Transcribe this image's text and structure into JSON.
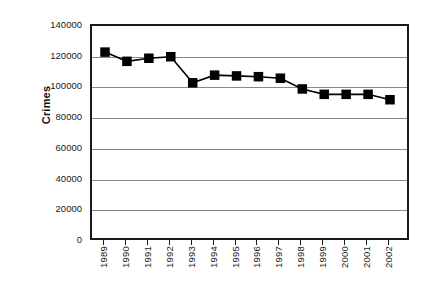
{
  "chart_data": {
    "type": "line",
    "title": "",
    "xlabel": "",
    "ylabel": "Crimes",
    "categories": [
      "1989",
      "1990",
      "1991",
      "1992",
      "1993",
      "1994",
      "1995",
      "1996",
      "1997",
      "1998",
      "1999",
      "2000",
      "2001",
      "2002"
    ],
    "values": [
      123000,
      117000,
      119000,
      120000,
      103000,
      108000,
      107500,
      107000,
      106000,
      99000,
      95500,
      95500,
      95500,
      92000
    ],
    "series": [
      {
        "name": "Crimes",
        "values": [
          123000,
          117000,
          119000,
          120000,
          103000,
          108000,
          107500,
          107000,
          106000,
          99000,
          95500,
          95500,
          95500,
          92000
        ]
      }
    ],
    "ylim": [
      0,
      140000
    ],
    "y_ticks": [
      0,
      20000,
      40000,
      60000,
      80000,
      100000,
      120000,
      140000
    ],
    "y_tick_labels": [
      "0",
      "20000",
      "40000",
      "60000",
      "80000",
      "100000",
      "120000",
      "140000"
    ],
    "grid": true,
    "legend": false,
    "legend_position": "none",
    "marker": "square",
    "marker_color": "#000000",
    "line_color": "#000000",
    "gridline_color": "#8a8a8a",
    "axis_color": "#1a1a1a",
    "background_color": "#ffffff"
  },
  "axes": {
    "y_title": "Crimes"
  }
}
